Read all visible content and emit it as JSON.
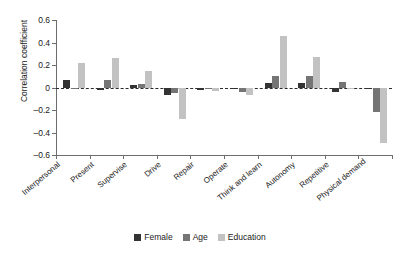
{
  "chart_data": {
    "type": "bar",
    "title": "",
    "xlabel": "",
    "ylabel": "Correlation coefficient",
    "ylim": [
      -0.6,
      0.6
    ],
    "yticks": [
      0.6,
      0.4,
      0.2,
      0,
      -0.2,
      -0.4,
      -0.6
    ],
    "ytick_labels": [
      "0.6",
      "0.4",
      "0.2",
      "0",
      "–0.2",
      "–0.4",
      "–0.6"
    ],
    "grid": false,
    "zero_reference_line": true,
    "legend_position": "bottom",
    "categories": [
      "Interpersonal",
      "Present",
      "Supervise",
      "Drive",
      "Repair",
      "Operate",
      "Think and learn",
      "Autonomy",
      "Repetitive",
      "Physical demand"
    ],
    "series": [
      {
        "name": "Female",
        "color": "#333333",
        "values": [
          0.07,
          -0.02,
          0.02,
          -0.07,
          -0.02,
          -0.01,
          0.04,
          0.04,
          -0.04,
          0.0
        ]
      },
      {
        "name": "Age",
        "color": "#757575",
        "values": [
          -0.01,
          0.07,
          0.03,
          -0.05,
          0.0,
          -0.04,
          0.1,
          0.1,
          0.05,
          -0.22
        ]
      },
      {
        "name": "Education",
        "color": "#c2c2c2",
        "values": [
          0.22,
          0.26,
          0.15,
          -0.28,
          -0.03,
          -0.07,
          0.46,
          0.27,
          0.0,
          -0.49
        ]
      }
    ]
  },
  "legend": {
    "items": [
      {
        "label": "Female",
        "color": "#333333"
      },
      {
        "label": "Age",
        "color": "#757575"
      },
      {
        "label": "Education",
        "color": "#c2c2c2"
      }
    ]
  }
}
